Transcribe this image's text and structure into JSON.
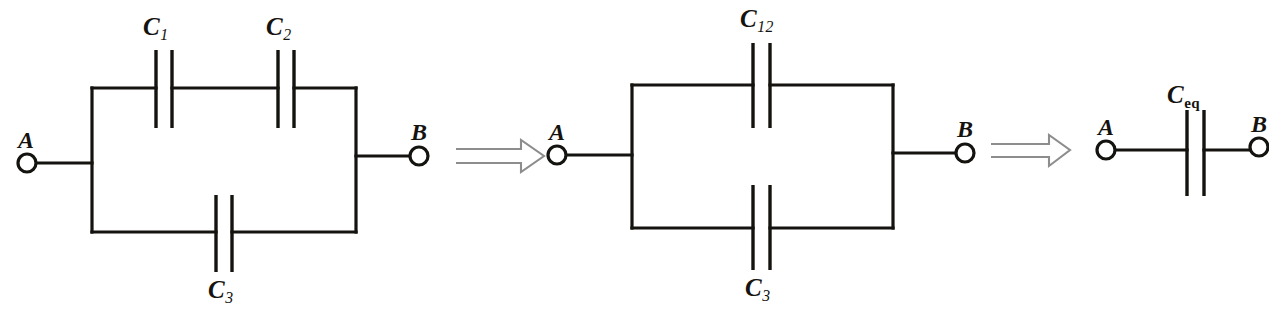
{
  "figure": {
    "kind": "circuit-diagram",
    "width": 1269,
    "height": 315,
    "background_color": "#ffffff",
    "line_color": "#15130f",
    "arrow_color": "#8d8d8d"
  },
  "stages": [
    {
      "id": "stage-1",
      "name": "original-network",
      "terminals": {
        "left": "A",
        "right": "B"
      },
      "branches": [
        {
          "position": "top",
          "capacitors": [
            "C1",
            "C2"
          ]
        },
        {
          "position": "bottom",
          "capacitors": [
            "C3"
          ]
        }
      ],
      "labels": {
        "c1": "C",
        "c1_sub": "1",
        "c2": "C",
        "c2_sub": "2",
        "c3": "C",
        "c3_sub": "3",
        "terminal_a": "A",
        "terminal_b": "B"
      }
    },
    {
      "id": "stage-2",
      "name": "series-pair-combined",
      "terminals": {
        "left": "A",
        "right": "B"
      },
      "branches": [
        {
          "position": "top",
          "capacitors": [
            "C12"
          ]
        },
        {
          "position": "bottom",
          "capacitors": [
            "C3"
          ]
        }
      ],
      "labels": {
        "c12": "C",
        "c12_sub": "12",
        "c3": "C",
        "c3_sub": "3",
        "terminal_a": "A",
        "terminal_b": "B"
      }
    },
    {
      "id": "stage-3",
      "name": "equivalent-capacitor",
      "terminals": {
        "left": "A",
        "right": "B"
      },
      "branches": [
        {
          "position": "single",
          "capacitors": [
            "Ceq"
          ]
        }
      ],
      "labels": {
        "ceq": "C",
        "ceq_sub": "eq",
        "terminal_a": "A",
        "terminal_b": "B"
      }
    }
  ],
  "arrows": [
    {
      "id": "arrow-1",
      "glyph": "double-right-arrow",
      "meaning": "reduces to"
    },
    {
      "id": "arrow-2",
      "glyph": "double-right-arrow",
      "meaning": "reduces to"
    }
  ]
}
